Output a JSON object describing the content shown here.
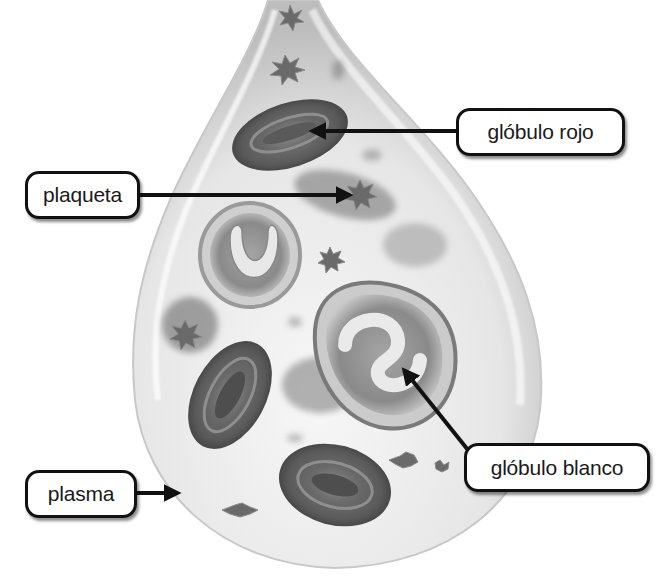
{
  "diagram": {
    "labels": {
      "red_blood_cell": "glóbulo rojo",
      "platelet": "plaqueta",
      "white_blood_cell": "glóbulo blanco",
      "plasma": "plasma"
    },
    "colors": {
      "label_border": "#111111",
      "label_fill": "#ffffff",
      "arrow": "#111111",
      "drop_fill": "#eeeeee",
      "cell_dark": "#555555"
    }
  }
}
